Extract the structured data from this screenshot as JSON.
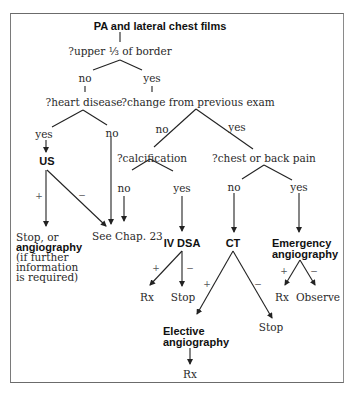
{
  "diagram": {
    "root": "PA and lateral chest films",
    "q_upper": "?upper ⅓ of border",
    "upper_no": "no",
    "upper_yes": "yes",
    "q_heart": "?heart disease",
    "heart_yes": "yes",
    "heart_no": "no",
    "us": "US",
    "us_plus": "+",
    "us_minus": "−",
    "stop_or": "Stop, or",
    "angiography": "angiography",
    "if_further": "(if further",
    "information": "information",
    "is_required": "is required)",
    "see_chap": "See Chap. 23",
    "q_change": "?change from previous exam",
    "change_no": "no",
    "change_yes": "yes",
    "q_calc": "?calcification",
    "calc_no": "no",
    "calc_yes": "yes",
    "iv_dsa": "IV DSA",
    "dsa_plus": "+",
    "dsa_minus": "−",
    "dsa_rx": "Rx",
    "dsa_stop": "Stop",
    "q_pain": "?chest or back pain",
    "pain_no": "no",
    "pain_yes": "yes",
    "ct": "CT",
    "ct_plus": "+",
    "ct_minus": "−",
    "ct_stop": "Stop",
    "elective_1": "Elective",
    "elective_2": "angiography",
    "elective_rx": "Rx",
    "emergency_1": "Emergency",
    "emergency_2": "angiography",
    "em_plus": "+",
    "em_minus": "−",
    "em_rx": "Rx",
    "em_observe": "Observe"
  }
}
